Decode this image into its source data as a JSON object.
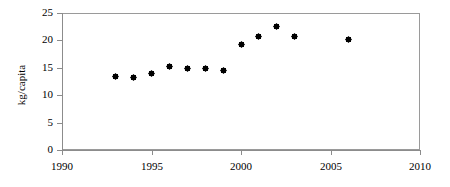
{
  "chart_data": {
    "type": "scatter",
    "title": "",
    "xlabel": "",
    "ylabel": "kg/capita",
    "xlim": [
      1990,
      2010
    ],
    "ylim": [
      0,
      25
    ],
    "xticks": [
      1990,
      1995,
      2000,
      2005,
      2010
    ],
    "xtick_labels": [
      "1990",
      "1995",
      "2000",
      "2005",
      "2010"
    ],
    "yticks": [
      0,
      5,
      10,
      15,
      20,
      25
    ],
    "ytick_labels": [
      "0",
      "5",
      "10",
      "15",
      "20",
      "25"
    ],
    "grid": false,
    "legend": null,
    "marker": "diamond",
    "marker_color": "#000000",
    "series": [
      {
        "name": "kg/capita",
        "x": [
          1993,
          1994,
          1995,
          1996,
          1997,
          1998,
          1999,
          2000,
          2001,
          2002,
          2003,
          2006
        ],
        "values": [
          13.4,
          13.2,
          13.9,
          15.2,
          14.9,
          14.8,
          14.5,
          19.2,
          20.8,
          22.5,
          20.7,
          20.2
        ]
      }
    ]
  },
  "axis": {
    "y_title": "kg/capita"
  }
}
